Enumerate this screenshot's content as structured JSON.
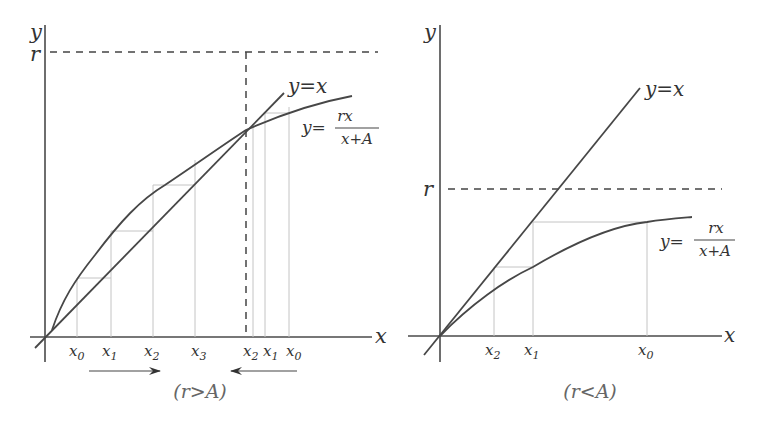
{
  "figure": {
    "left_panel": {
      "axis_labels": {
        "x": "x",
        "y": "y",
        "r": "r"
      },
      "line_label": "y=x",
      "curve_label": {
        "lhs": "y=",
        "numerator": "rx",
        "denominator": "x+A"
      },
      "left_ticks": [
        "x0",
        "x1",
        "x2",
        "x3"
      ],
      "right_ticks": [
        "x2",
        "x1",
        "x0"
      ],
      "caption": "(r>A)",
      "colors": {
        "stroke": "#474747",
        "grid": "#c4c4c4",
        "text": "#333333"
      }
    },
    "right_panel": {
      "axis_labels": {
        "x": "x",
        "y": "y",
        "r": "r"
      },
      "line_label": "y=x",
      "curve_label": {
        "lhs": "y=",
        "numerator": "rx",
        "denominator": "x+A"
      },
      "ticks": [
        "x2",
        "x1",
        "x0"
      ],
      "caption": "(r<A)"
    }
  }
}
